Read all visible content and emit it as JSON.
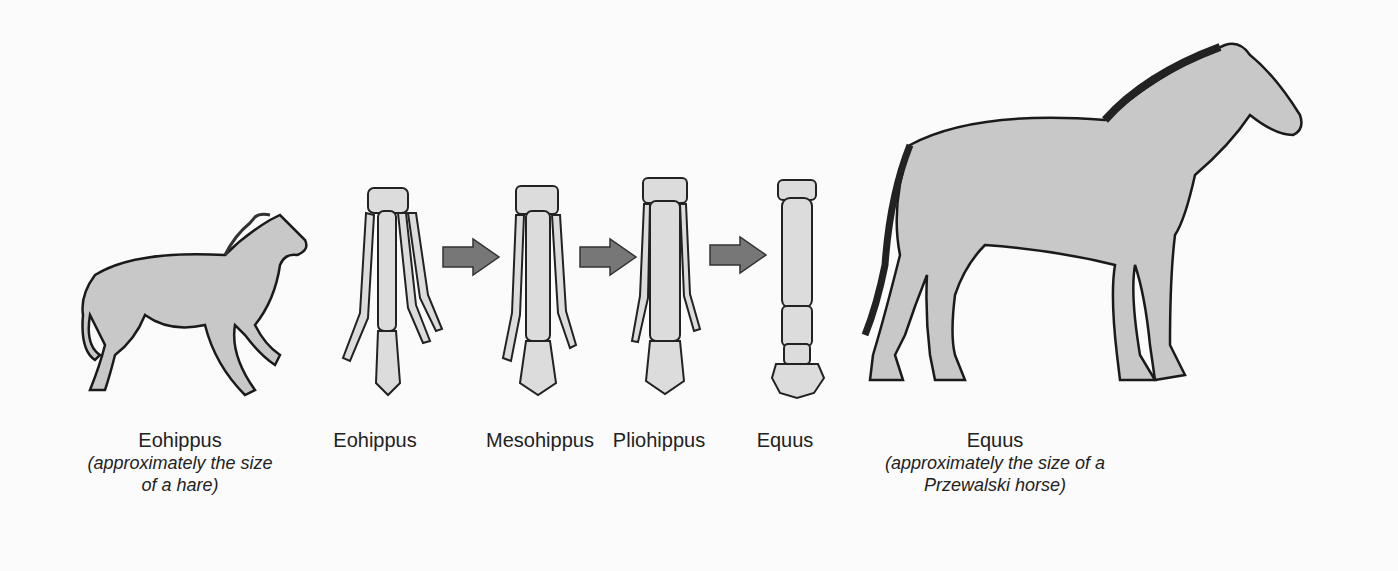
{
  "colors": {
    "background": "#fbfbfb",
    "body_fill": "#c8c8c8",
    "bone_fill": "#dcdcdc",
    "arrow_fill": "#777777",
    "outline": "#1a1a1a"
  },
  "figures": [
    {
      "name": "Eohippus",
      "caption": "(approximately the size of a hare)",
      "caption_lines": [
        "(approximately the size",
        "of a hare)"
      ],
      "kind": "whole-animal"
    },
    {
      "name": "Eohippus",
      "kind": "foot-bones",
      "toes": 4
    },
    {
      "name": "Mesohippus",
      "kind": "foot-bones",
      "toes": 3
    },
    {
      "name": "Pliohippus",
      "kind": "foot-bones",
      "toes": 3
    },
    {
      "name": "Equus",
      "kind": "foot-bones",
      "toes": 1
    },
    {
      "name": "Equus",
      "caption": "(approximately the size of a Przewalski horse)",
      "caption_lines": [
        "(approximately the size of a",
        "Przewalski horse)"
      ],
      "kind": "whole-animal"
    }
  ],
  "arrows": [
    {
      "from": "Eohippus",
      "to": "Mesohippus",
      "icon": "right-arrow-icon"
    },
    {
      "from": "Mesohippus",
      "to": "Pliohippus",
      "icon": "right-arrow-icon"
    },
    {
      "from": "Pliohippus",
      "to": "Equus",
      "icon": "right-arrow-icon"
    }
  ]
}
